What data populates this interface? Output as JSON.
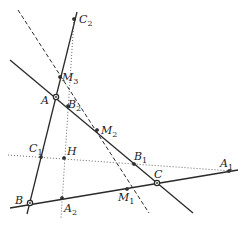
{
  "diagram": {
    "colors": {
      "line": "#2a2a2a",
      "background": "#ffffff"
    },
    "lines": [
      {
        "name": "line-AB",
        "style": "solid",
        "x1": 77,
        "y1": 12,
        "x2": 27,
        "y2": 214
      },
      {
        "name": "line-AC",
        "style": "solid",
        "x1": 10,
        "y1": 60,
        "x2": 193,
        "y2": 213
      },
      {
        "name": "line-BC",
        "style": "solid",
        "x1": 10,
        "y1": 208,
        "x2": 238,
        "y2": 170
      },
      {
        "name": "line-median-dashed",
        "style": "dashed",
        "x1": 18,
        "y1": 10,
        "x2": 149,
        "y2": 213
      },
      {
        "name": "line-horizontal-dotted",
        "style": "dotted",
        "x1": 8,
        "y1": 155,
        "x2": 232,
        "y2": 171
      },
      {
        "name": "line-vertical-dotted",
        "style": "dotted",
        "x1": 74,
        "y1": 19,
        "x2": 61,
        "y2": 218
      }
    ],
    "points": [
      {
        "id": "A",
        "base": "A",
        "sub": "",
        "x": 56,
        "y": 97,
        "big": true,
        "lx": 41,
        "ly": 104
      },
      {
        "id": "B",
        "base": "B",
        "sub": "",
        "x": 30,
        "y": 203,
        "big": true,
        "lx": 15,
        "ly": 204
      },
      {
        "id": "C",
        "base": "C",
        "sub": "",
        "x": 157,
        "y": 183,
        "big": true,
        "lx": 154,
        "ly": 178
      },
      {
        "id": "A1",
        "base": "A",
        "sub": "1",
        "x": 229,
        "y": 171,
        "big": false,
        "lx": 220,
        "ly": 167
      },
      {
        "id": "A2",
        "base": "A",
        "sub": "2",
        "x": 62,
        "y": 198,
        "big": false,
        "lx": 64,
        "ly": 212
      },
      {
        "id": "B1",
        "base": "B",
        "sub": "1",
        "x": 134,
        "y": 164,
        "big": false,
        "lx": 134,
        "ly": 160
      },
      {
        "id": "B2",
        "base": "B",
        "sub": "2",
        "x": 68,
        "y": 106,
        "big": false,
        "lx": 68,
        "ly": 108
      },
      {
        "id": "C1",
        "base": "C",
        "sub": "1",
        "x": 41,
        "y": 157,
        "big": false,
        "lx": 29,
        "ly": 152
      },
      {
        "id": "C2",
        "base": "C",
        "sub": "2",
        "x": 74,
        "y": 19,
        "big": false,
        "lx": 79,
        "ly": 23
      },
      {
        "id": "H",
        "base": "H",
        "sub": "",
        "x": 64,
        "y": 158,
        "big": false,
        "lx": 67,
        "ly": 155
      },
      {
        "id": "M1",
        "base": "M",
        "sub": "1",
        "x": 127,
        "y": 189,
        "big": false,
        "lx": 118,
        "ly": 201
      },
      {
        "id": "M2",
        "base": "M",
        "sub": "2",
        "x": 97,
        "y": 130,
        "big": false,
        "lx": 101,
        "ly": 134
      },
      {
        "id": "M3",
        "base": "M",
        "sub": "3",
        "x": 60,
        "y": 77,
        "big": false,
        "lx": 62,
        "ly": 81
      }
    ]
  }
}
